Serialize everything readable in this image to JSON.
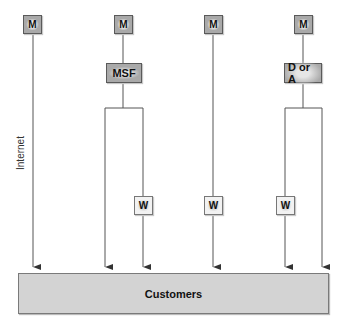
{
  "diagram": {
    "side_label": "Internet",
    "top_nodes": [
      {
        "label": "M"
      },
      {
        "label": "M"
      },
      {
        "label": "M"
      },
      {
        "label": "M"
      }
    ],
    "mid_nodes": [
      {
        "label": "MSF"
      },
      {
        "label": "D or A"
      }
    ],
    "w_nodes": [
      {
        "label": "W"
      },
      {
        "label": "W"
      },
      {
        "label": "W"
      }
    ],
    "target": {
      "label": "Customers"
    },
    "colors": {
      "node_fill": "#a9a9a9",
      "w_fill": "#f2f2f2",
      "customers_fill": "#d3d3d3",
      "line": "#444444"
    }
  }
}
